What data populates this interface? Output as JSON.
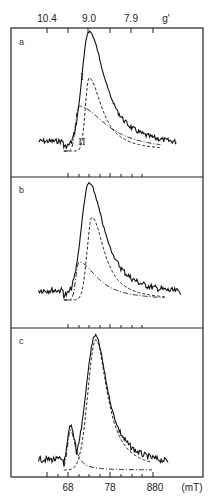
{
  "chart_data": {
    "type": "line",
    "title": "",
    "top_axis": {
      "label": "g'",
      "tick_labels": [
        "10.4",
        "9.0",
        "7.9"
      ],
      "tick_count": 6
    },
    "bottom_axis": {
      "label": "(mT)",
      "tick_labels": [
        "68",
        "78",
        "880"
      ],
      "range": [
        60,
        98
      ]
    },
    "panels": [
      {
        "label": "a",
        "components": [
          "I",
          "II"
        ],
        "series": [
          {
            "name": "experimental",
            "style": "solid",
            "peak_x_mT": 73.0,
            "peak_rel": 1.0
          },
          {
            "name": "I",
            "style": "dashed",
            "peak_x_mT": 73.0,
            "peak_rel": 0.62
          },
          {
            "name": "II",
            "style": "dash-dot",
            "peak_x_mT": 70.5,
            "peak_rel": 0.38
          }
        ]
      },
      {
        "label": "b",
        "components": [],
        "series": [
          {
            "name": "experimental",
            "style": "solid",
            "peak_x_mT": 73.0,
            "peak_rel": 1.0
          },
          {
            "name": "component 1",
            "style": "dashed",
            "peak_x_mT": 73.5,
            "peak_rel": 0.72
          },
          {
            "name": "component 2",
            "style": "dash-dot",
            "peak_x_mT": 70.5,
            "peak_rel": 0.33
          }
        ]
      },
      {
        "label": "c",
        "components": [],
        "series": [
          {
            "name": "experimental",
            "style": "solid",
            "peak_x_mT": 74.5,
            "peak_rel": 1.0
          },
          {
            "name": "component 1",
            "style": "dashed",
            "peak_x_mT": 74.5,
            "peak_rel": 0.98
          },
          {
            "name": "component 2",
            "style": "dash-dot",
            "peak_x_mT": 68.5,
            "peak_rel": 0.3
          }
        ]
      }
    ],
    "grid": false,
    "legend": "none"
  },
  "labels": {
    "top_ticks": [
      "10.4",
      "9.0",
      "7.9"
    ],
    "g_prime": "g'",
    "bottom_ticks": [
      "68",
      "78",
      "880"
    ],
    "unit": "(mT)",
    "panel_a": "a",
    "panel_b": "b",
    "panel_c": "c",
    "comp_I": "I",
    "comp_II": "II"
  }
}
